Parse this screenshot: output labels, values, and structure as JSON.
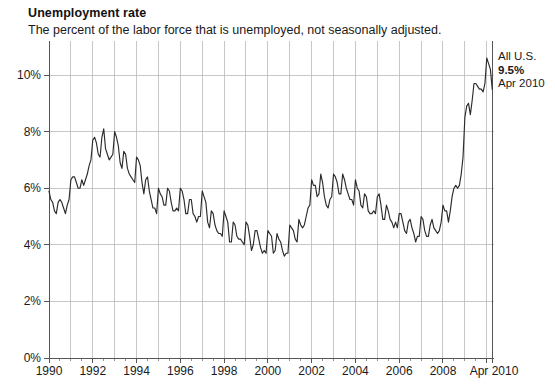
{
  "header": {
    "title": "Unemployment rate",
    "subtitle": "The percent of the labor force that is unemployed, not seasonally adjusted."
  },
  "annotation": {
    "region": "All U.S.",
    "value": "9.5%",
    "date": "Apr 2010"
  },
  "chart_data": {
    "type": "line",
    "title": "Unemployment rate",
    "subtitle": "The percent of the labor force that is unemployed, not seasonally adjusted.",
    "xlabel": "",
    "ylabel": "",
    "xlim": [
      1990.0,
      2010.33
    ],
    "ylim": [
      0,
      11.2
    ],
    "grid": true,
    "legend": null,
    "y_ticks": [
      0,
      2,
      4,
      6,
      8,
      10
    ],
    "y_tick_labels": [
      "0%",
      "2%",
      "4%",
      "6%",
      "8%",
      "10%"
    ],
    "x_ticks": [
      1990,
      1992,
      1994,
      1996,
      1998,
      2000,
      2002,
      2004,
      2006,
      2008,
      2010.33
    ],
    "x_tick_labels": [
      "1990",
      "1992",
      "1994",
      "1996",
      "1998",
      "2000",
      "2002",
      "2004",
      "2006",
      "2008",
      "Apr 2010"
    ],
    "x_minor_tick_step": 0.5,
    "series": [
      {
        "name": "All U.S. unemployment rate",
        "color": "#2b2b2b",
        "x_start": 1990.0,
        "x_step": 0.08333,
        "units": "percent",
        "last_point": {
          "x": 2010.25,
          "label": "Apr 2010",
          "value": 9.5
        },
        "values": [
          5.9,
          5.6,
          5.5,
          5.2,
          5.1,
          5.5,
          5.6,
          5.5,
          5.3,
          5.1,
          5.4,
          5.6,
          6.3,
          6.4,
          6.4,
          6.2,
          6.0,
          6.0,
          6.3,
          6.1,
          6.3,
          6.5,
          6.8,
          7.0,
          7.7,
          7.8,
          7.6,
          7.2,
          7.1,
          7.8,
          8.1,
          7.4,
          7.2,
          7.0,
          7.1,
          7.2,
          8.0,
          7.8,
          7.5,
          6.9,
          6.7,
          7.3,
          7.2,
          6.7,
          6.5,
          6.4,
          6.3,
          6.2,
          7.1,
          7.0,
          6.8,
          6.2,
          5.8,
          6.3,
          6.4,
          5.9,
          5.6,
          5.3,
          5.3,
          5.1,
          6.0,
          5.8,
          5.7,
          5.4,
          5.4,
          6.0,
          5.9,
          5.5,
          5.2,
          5.2,
          5.3,
          5.2,
          6.0,
          5.9,
          5.6,
          5.1,
          5.1,
          5.6,
          5.6,
          5.1,
          5.0,
          4.8,
          5.0,
          5.0,
          5.9,
          5.7,
          5.5,
          4.8,
          4.6,
          5.2,
          5.1,
          4.7,
          4.5,
          4.4,
          4.4,
          4.3,
          5.2,
          5.0,
          4.8,
          4.1,
          4.1,
          4.8,
          4.7,
          4.3,
          4.2,
          4.2,
          4.1,
          4.0,
          4.8,
          4.7,
          4.3,
          3.8,
          4.0,
          4.5,
          4.5,
          4.2,
          3.9,
          3.7,
          3.8,
          3.7,
          4.5,
          4.4,
          4.3,
          3.7,
          3.8,
          4.4,
          4.2,
          4.1,
          3.8,
          3.6,
          3.7,
          3.7,
          4.7,
          4.6,
          4.5,
          4.2,
          4.1,
          4.9,
          4.7,
          4.6,
          4.7,
          5.0,
          5.3,
          5.4,
          6.3,
          6.1,
          6.1,
          5.7,
          5.8,
          6.5,
          6.2,
          5.7,
          5.4,
          5.3,
          5.6,
          5.7,
          6.5,
          6.4,
          6.2,
          5.8,
          5.8,
          6.5,
          6.3,
          6.0,
          5.8,
          5.6,
          5.6,
          5.4,
          6.3,
          6.0,
          5.9,
          5.4,
          5.3,
          5.8,
          5.7,
          5.2,
          5.1,
          5.1,
          5.2,
          5.1,
          5.7,
          5.8,
          5.4,
          4.9,
          4.9,
          5.4,
          5.2,
          4.9,
          4.8,
          4.6,
          4.8,
          4.6,
          5.1,
          5.1,
          4.8,
          4.5,
          4.4,
          4.8,
          4.9,
          4.6,
          4.4,
          4.1,
          4.3,
          4.3,
          5.0,
          4.9,
          4.5,
          4.3,
          4.3,
          4.7,
          4.9,
          4.6,
          4.5,
          4.4,
          4.5,
          4.8,
          5.4,
          5.2,
          5.2,
          4.8,
          5.2,
          5.7,
          6.0,
          6.1,
          6.0,
          6.1,
          6.5,
          7.1,
          8.5,
          8.9,
          9.0,
          8.6,
          9.1,
          9.7,
          9.7,
          9.6,
          9.5,
          9.5,
          9.4,
          9.7,
          10.6,
          10.4,
          10.2,
          9.5
        ]
      }
    ],
    "annotation": {
      "text_lines": [
        "All U.S.",
        "9.5%",
        "Apr 2010"
      ],
      "anchor_x": 2010.25,
      "anchor_y": 9.5
    }
  },
  "geometry": {
    "plot_left": 49,
    "plot_right": 494,
    "plot_bottom": 358,
    "y_top_value": 11.2,
    "y_pixels_per_percent": 28.3
  }
}
